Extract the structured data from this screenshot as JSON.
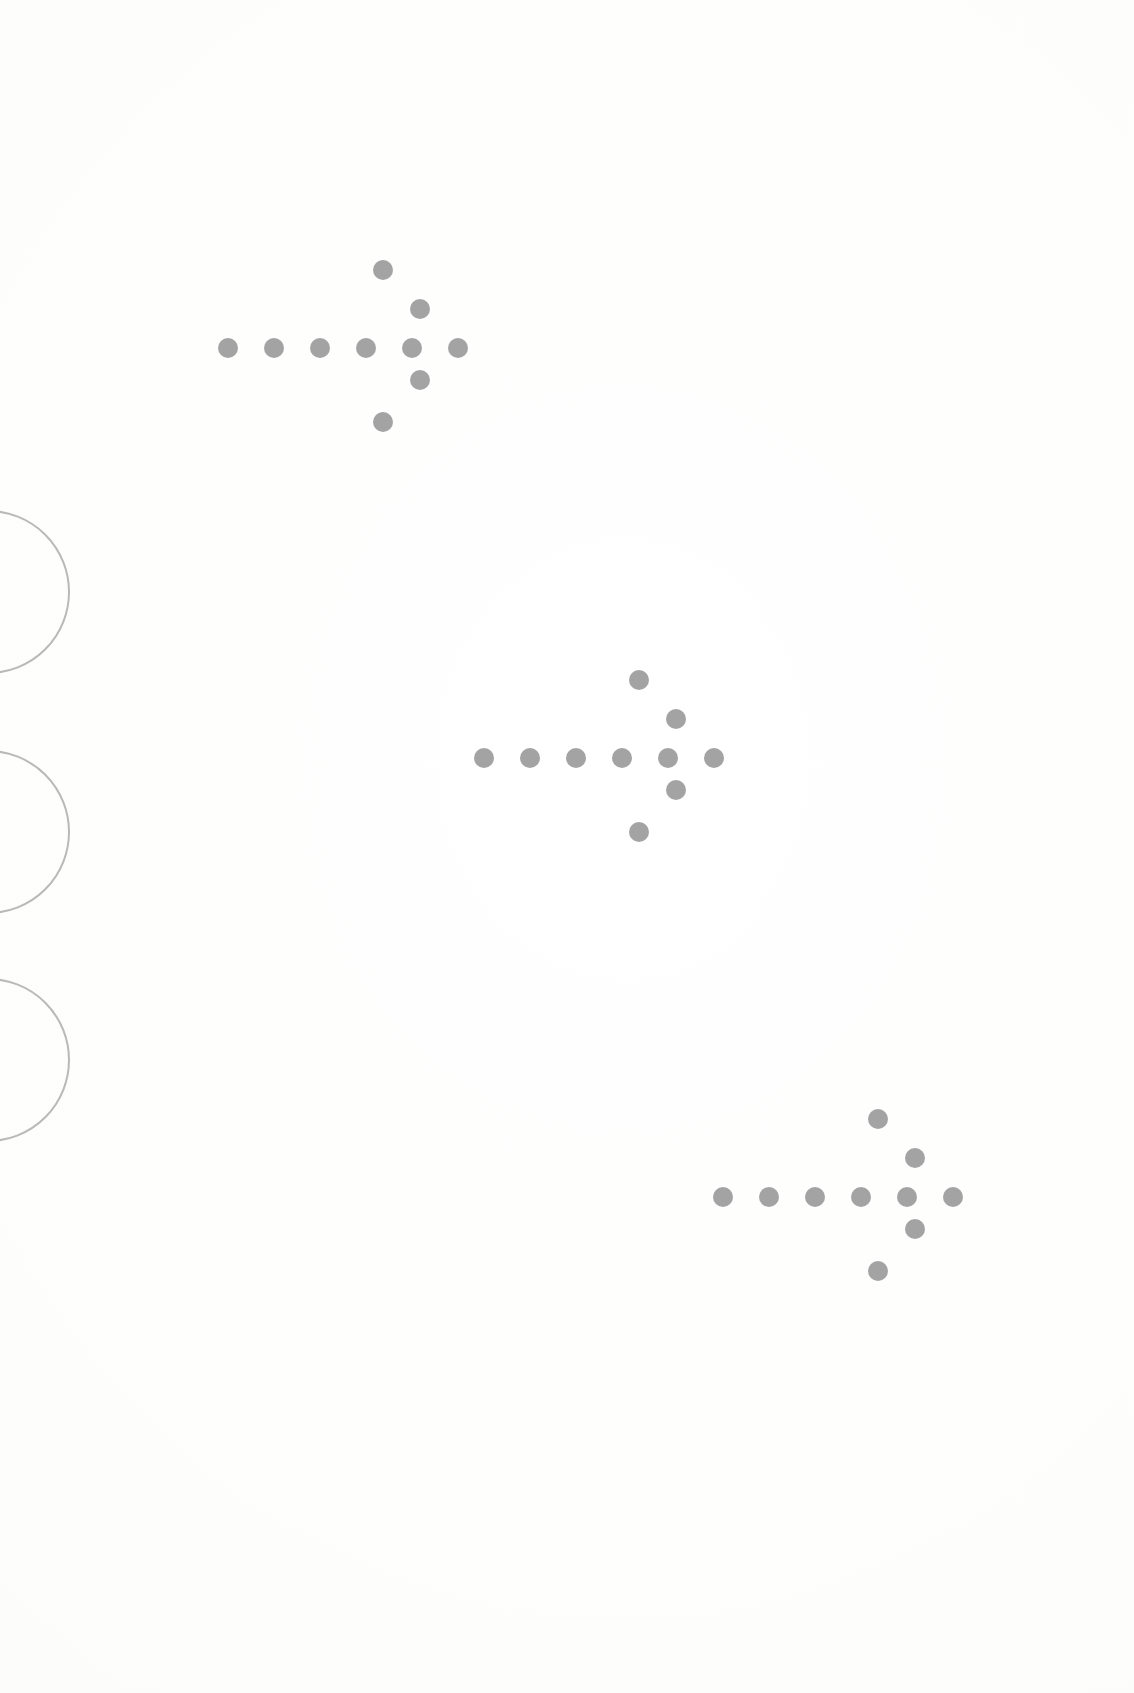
{
  "page": {
    "title": "Scanned page with dotted arrow marks",
    "width": 1134,
    "height": 1693,
    "background_color": "#fdfdfc",
    "description": "Blank scanned sheet bearing three identical right-pointing dotted arrow glyphs arranged along a diagonal, with three partially cropped thin circle outlines along the left edge."
  },
  "palette": {
    "dot_color": "#9b9b9b",
    "circle_stroke_color": "#b9b9b9",
    "paper_color": "#fdfdfc"
  },
  "arrow_glyph": {
    "name": "dotted-right-arrow",
    "dot_count": 10,
    "dot_diameter": 20,
    "shaft_dot_count": 6,
    "shaft_spacing": 46,
    "head_dot_count": 4,
    "shaft_offsets": [
      {
        "dx": 0,
        "dy": 0
      },
      {
        "dx": 46,
        "dy": 0
      },
      {
        "dx": 92,
        "dy": 0
      },
      {
        "dx": 138,
        "dy": 0
      },
      {
        "dx": 184,
        "dy": 0
      },
      {
        "dx": 230,
        "dy": 0
      }
    ],
    "head_offsets": [
      {
        "dx": 155,
        "dy": -78
      },
      {
        "dx": 192,
        "dy": -39
      },
      {
        "dx": 192,
        "dy": 32
      },
      {
        "dx": 155,
        "dy": 74
      }
    ]
  },
  "arrows": [
    {
      "id": "arrow-top-left",
      "label": "Arrow 1",
      "origin_x": 228,
      "origin_y": 348,
      "position_note": "upper-left"
    },
    {
      "id": "arrow-middle",
      "label": "Arrow 2",
      "origin_x": 484,
      "origin_y": 758,
      "position_note": "center"
    },
    {
      "id": "arrow-bottom-right",
      "label": "Arrow 3",
      "origin_x": 723,
      "origin_y": 1197,
      "position_note": "lower-right"
    }
  ],
  "edge_circles": [
    {
      "id": "edge-circle-1",
      "label": "Circle 1",
      "center_x": -12,
      "center_y": 592,
      "radius": 82
    },
    {
      "id": "edge-circle-2",
      "label": "Circle 2",
      "center_x": -12,
      "center_y": 832,
      "radius": 82
    },
    {
      "id": "edge-circle-3",
      "label": "Circle 3",
      "center_x": -12,
      "center_y": 1060,
      "radius": 82
    }
  ]
}
